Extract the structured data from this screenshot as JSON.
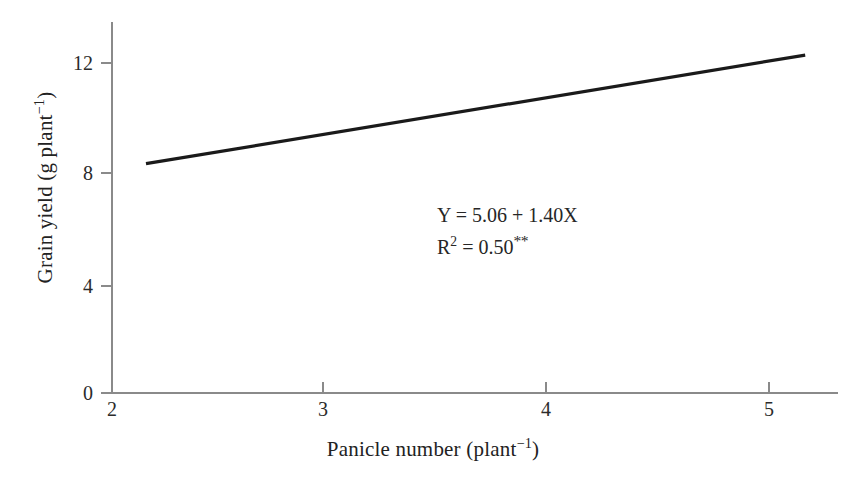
{
  "chart_data": {
    "type": "line",
    "title": "",
    "subtitle": "",
    "xlabel_plain": "Panicle number (plant-1)",
    "ylabel_plain": "Grain yield (g plant-1)",
    "xlabel_base": "Panicle number (plant",
    "xlabel_sup": "−1",
    "xlabel_tail": ")",
    "ylabel_base": "Grain yield (g plant",
    "ylabel_sup": "−1",
    "ylabel_tail": ")",
    "xlim": [
      2,
      5.32
    ],
    "ylim": [
      0,
      13.45
    ],
    "xticks": [
      2,
      3,
      4,
      5
    ],
    "xtick_labels": [
      "2",
      "3",
      "4",
      "5"
    ],
    "yticks": [
      0,
      4,
      8,
      12
    ],
    "ytick_labels": [
      "0",
      "4",
      "8",
      "12"
    ],
    "grid": false,
    "legend": false,
    "series": [
      {
        "name": "regression fit",
        "kind": "line",
        "color": "#1a1a1a",
        "linewidth": 3.2,
        "x": [
          2.16,
          5.17
        ],
        "values": [
          8.3,
          12.25
        ]
      }
    ],
    "annotations": [
      {
        "name": "regression-equation",
        "text": "Y = 5.06 + 1.40X",
        "x": 3.5,
        "y": 7.0
      },
      {
        "name": "r-squared",
        "text_base": "R",
        "text_sup": "2",
        "text_rest": " = 0.50",
        "significance": "**",
        "text": "R2 = 0.50**",
        "x": 3.5,
        "y": 6.0
      }
    ],
    "regression": {
      "intercept": 5.06,
      "slope": 1.4,
      "r_squared": 0.5,
      "significance": "**"
    }
  },
  "axis": {
    "color": "#8a8a8a",
    "tick_color": "#8a8a8a"
  },
  "colors": {
    "background": "#ffffff",
    "line": "#1a1a1a",
    "text": "#222222"
  }
}
